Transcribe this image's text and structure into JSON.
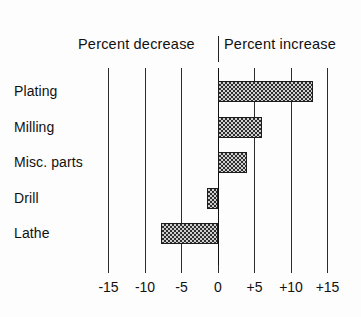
{
  "chart_data": {
    "type": "bar",
    "orientation": "horizontal",
    "title": "",
    "subtitle": "",
    "xlabel": "",
    "ylabel": "",
    "categories": [
      "Plating",
      "Milling",
      "Misc. parts",
      "Drill",
      "Lathe"
    ],
    "values": [
      13,
      6,
      4,
      -1.5,
      -7.8
    ],
    "series": [
      {
        "name": "Percent change",
        "values": [
          13,
          6,
          4,
          -1.5,
          -7.8
        ]
      }
    ],
    "xlim": [
      -15,
      15
    ],
    "xticks": [
      -15,
      -10,
      -5,
      0,
      5,
      10,
      15
    ],
    "xticklabels": [
      "-15",
      "-10",
      "-5",
      "0",
      "+5",
      "+10",
      "+15"
    ],
    "grid": true,
    "gridlines_axis": "x",
    "legend": false,
    "legend_position": "none",
    "annotations": [
      {
        "text": "Percent decrease",
        "side": "left"
      },
      {
        "text": "Percent increase",
        "side": "right"
      }
    ],
    "zero_line": 0,
    "bar_fill": "checkerboard-hatch",
    "colors": {
      "bar_fill_light": "#cfcfcf",
      "bar_fill_dark": "#2e2e2e",
      "bar_border": "#1c1c1c",
      "gridline": "#2b2b2b",
      "text": "#111111",
      "background": "#fdfdfd"
    }
  },
  "header": {
    "decrease_label": "Percent decrease",
    "increase_label": "Percent increase"
  }
}
